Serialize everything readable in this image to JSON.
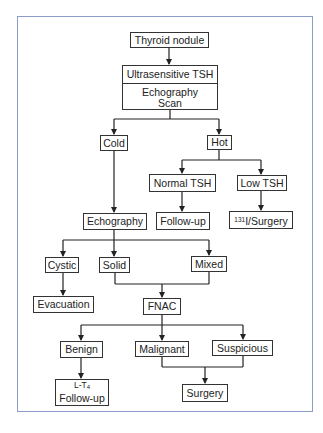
{
  "diagram": {
    "nodes": {
      "thyroid_nodule": "Thyroid nodule",
      "ultrasensitive_tsh": "Ultrasensitive TSH",
      "echography_scan_line1": "Echography",
      "echography_scan_line2": "Scan",
      "cold": "Cold",
      "hot": "Hot",
      "normal_tsh": "Normal TSH",
      "low_tsh": "Low TSH",
      "follow_up": "Follow-up",
      "iodine_surgery_sup": "131",
      "iodine_surgery": "I/Surgery",
      "echography": "Echography",
      "cystic": "Cystic",
      "solid": "Solid",
      "mixed": "Mixed",
      "evacuation": "Evacuation",
      "fnac": "FNAC",
      "benign": "Benign",
      "malignant": "Malignant",
      "suspicious": "Suspicious",
      "lt4_prefix": "L-T",
      "lt4_sub": "4",
      "lt4_follow_up": "Follow-up",
      "surgery": "Surgery"
    },
    "edges": [
      [
        "Thyroid nodule",
        "Ultrasensitive TSH / Echography Scan"
      ],
      [
        "Ultrasensitive TSH / Echography Scan",
        "Cold"
      ],
      [
        "Ultrasensitive TSH / Echography Scan",
        "Hot"
      ],
      [
        "Hot",
        "Normal TSH"
      ],
      [
        "Hot",
        "Low TSH"
      ],
      [
        "Normal TSH",
        "Follow-up"
      ],
      [
        "Low TSH",
        "131I/Surgery"
      ],
      [
        "Cold",
        "Echography"
      ],
      [
        "Echography",
        "Cystic"
      ],
      [
        "Echography",
        "Solid"
      ],
      [
        "Echography",
        "Mixed"
      ],
      [
        "Cystic",
        "Evacuation"
      ],
      [
        "Solid",
        "FNAC"
      ],
      [
        "Mixed",
        "FNAC"
      ],
      [
        "FNAC",
        "Benign"
      ],
      [
        "FNAC",
        "Malignant"
      ],
      [
        "FNAC",
        "Suspicious"
      ],
      [
        "Benign",
        "L-T4 Follow-up"
      ],
      [
        "Malignant",
        "Surgery"
      ],
      [
        "Suspicious",
        "Surgery"
      ]
    ],
    "colors": {
      "frame_border": "#8d9bc9",
      "line": "#222222",
      "box_border": "#333333"
    }
  }
}
